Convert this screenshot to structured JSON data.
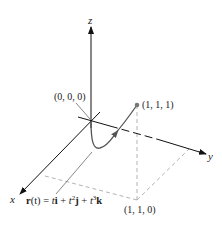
{
  "figure": {
    "type": "3d-space-curve",
    "axes": {
      "x": {
        "label": "x"
      },
      "y": {
        "label": "y"
      },
      "z": {
        "label": "z"
      }
    },
    "points": [
      {
        "id": "origin",
        "label": "(0, 0, 0)"
      },
      {
        "id": "end",
        "label": "(1, 1, 1)"
      },
      {
        "id": "projection",
        "label": "(1, 1, 0)"
      }
    ],
    "equation": {
      "r": "r",
      "t_paren": "(t)",
      "eq": " = ",
      "t1": "t",
      "i": "i",
      "plus1": " + ",
      "t2": "t",
      "sup2": "2",
      "j": "j",
      "plus2": " + ",
      "t3": "t",
      "sup3": "3",
      "k": "k"
    },
    "colors": {
      "axis": "#111111",
      "curve": "#555555",
      "dashed": "#aaaaaa",
      "point": "#777777"
    }
  }
}
